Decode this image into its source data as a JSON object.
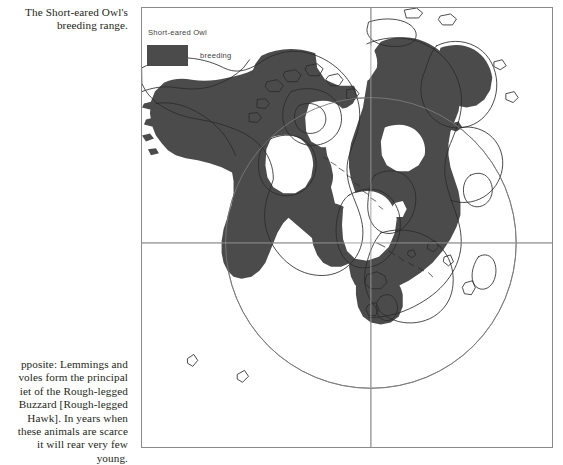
{
  "captions": {
    "top": {
      "lines": [
        "The Short-eared Owl's",
        "breeding range."
      ]
    },
    "bottom": {
      "lines": [
        "pposite: Lemmings and",
        "voles form the principal",
        "iet of the Rough-legged",
        "Buzzard [Rough-legged",
        "Hawk]. In years when",
        "these animals are scarce",
        "it will rear very few",
        "young."
      ]
    }
  },
  "map": {
    "legend": {
      "title": "Short-eared Owl",
      "swatch_label": "breeding",
      "swatch_color": "#4b4b4b"
    },
    "projection": {
      "type": "polar-azimuthal",
      "center_label": "North Pole",
      "center_x": 230,
      "center_y": 236,
      "circle_radius": 146,
      "circle_color": "#6f6f6f",
      "graticule_color": "#8f8f8f",
      "coast_color": "#2b2b2b",
      "frame_color": "#8a8a8a",
      "ocean_color": "#ffffff"
    },
    "range_fill_color": "#4b4b4b"
  }
}
